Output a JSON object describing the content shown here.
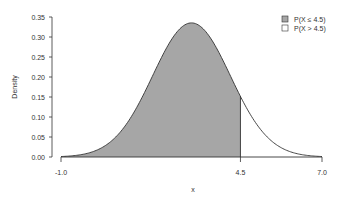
{
  "chart_data": {
    "type": "area",
    "title": "",
    "xlabel": "x",
    "ylabel": "Density",
    "distribution": "normal",
    "mean": 3.0,
    "sd": 1.19,
    "xlim": [
      -1.0,
      7.0
    ],
    "ylim": [
      0.0,
      0.35
    ],
    "cutoff": 4.5,
    "x_ticks": [
      "-1.0",
      "4.5",
      "7.0"
    ],
    "y_ticks": [
      "0.00",
      "0.05",
      "0.10",
      "0.15",
      "0.20",
      "0.25",
      "0.30",
      "0.35"
    ],
    "series": [
      {
        "name": "P(X ≤ 4.5)",
        "fill": "#a6a6a6",
        "range": [
          -1.0,
          4.5
        ]
      },
      {
        "name": "P(X > 4.5)",
        "fill": "#ffffff",
        "range": [
          4.5,
          7.0
        ]
      }
    ],
    "peak_density": 0.335,
    "grid": false,
    "legend_position": "top-right"
  },
  "legend": {
    "items": [
      {
        "label": "P(X ≤ 4.5)",
        "color": "#a6a6a6"
      },
      {
        "label": "P(X > 4.5)",
        "color": "#ffffff"
      }
    ]
  },
  "axes": {
    "x_label": "x",
    "y_label": "Density"
  }
}
